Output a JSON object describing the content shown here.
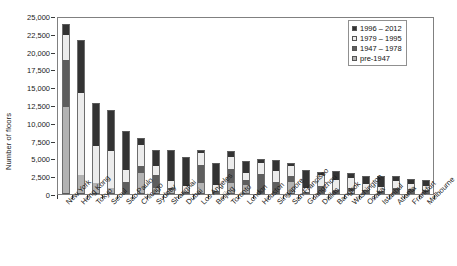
{
  "chart_data": {
    "type": "bar",
    "title": "",
    "subtitle": "",
    "xlabel": "",
    "ylabel": "Number of floors",
    "ylim": [
      0,
      25000
    ],
    "ytick_values": [
      0,
      2500,
      5000,
      7500,
      10000,
      12500,
      15000,
      17500,
      20000,
      22500,
      25000
    ],
    "ytick_labels": [
      "0",
      "2,500",
      "5,000",
      "7,500",
      "10,000",
      "12,500",
      "15,000",
      "17,500",
      "20,000",
      "22,500",
      "25,000"
    ],
    "grid": false,
    "stacked": true,
    "legend_position": "top-right",
    "categories": [
      "New York",
      "Hong Kong",
      "Tokyo",
      "Seoul",
      "Sao Paulo",
      "Chicago",
      "Sydney",
      "Shanghai",
      "Dubai",
      "Los Angeles",
      "Beijing",
      "Toronto",
      "London",
      "Houston",
      "Singapore",
      "San Francisco",
      "Guangzhou",
      "Dallas",
      "Bangkok",
      "Washington",
      "Osaka",
      "Istanbul",
      "Atlanta",
      "Frankfurt",
      "Melbourne"
    ],
    "series": [
      {
        "name": "1996 – 2012",
        "color": "#333333",
        "values": [
          1600,
          7500,
          6100,
          5800,
          5400,
          1000,
          2200,
          4400,
          4000,
          400,
          3100,
          900,
          1700,
          500,
          1500,
          400,
          2600,
          500,
          1300,
          700,
          1100,
          1500,
          700,
          800,
          900
        ]
      },
      {
        "name": "1979 – 1995",
        "color": "#ececec",
        "values": [
          3500,
          11500,
          5200,
          5100,
          1700,
          3000,
          1300,
          1000,
          800,
          1700,
          900,
          1700,
          1000,
          1600,
          1600,
          1500,
          500,
          1500,
          1400,
          1400,
          800,
          600,
          1000,
          700,
          500
        ]
      },
      {
        "name": "1947 – 1978",
        "color": "#5e5e5e",
        "values": [
          6600,
          0,
          0,
          0,
          1700,
          1000,
          1900,
          300,
          200,
          2500,
          200,
          1900,
          700,
          2600,
          1500,
          800,
          200,
          1000,
          400,
          400,
          400,
          300,
          600,
          500,
          400
        ]
      },
      {
        "name": "pre-1947",
        "color": "#b3b3b3",
        "values": [
          12200,
          2700,
          1500,
          900,
          0,
          2900,
          800,
          500,
          100,
          1600,
          200,
          1600,
          1300,
          200,
          200,
          1700,
          100,
          100,
          100,
          400,
          200,
          100,
          200,
          100,
          200
        ]
      }
    ],
    "totals": [
      23900,
      21700,
      12800,
      11800,
      8800,
      7900,
      6200,
      6200,
      5100,
      6200,
      4400,
      6100,
      4700,
      4900,
      4800,
      4400,
      3400,
      3100,
      3200,
      2900,
      2500,
      2500,
      2500,
      2100,
      2000
    ]
  },
  "legend": {
    "items": [
      {
        "label": "1996 – 2012",
        "swatch": "#333333"
      },
      {
        "label": "1979 – 1995",
        "swatch": "#ececec"
      },
      {
        "label": "1947 – 1978",
        "swatch": "#5e5e5e"
      },
      {
        "label": "pre-1947",
        "swatch": "#b3b3b3"
      }
    ]
  }
}
